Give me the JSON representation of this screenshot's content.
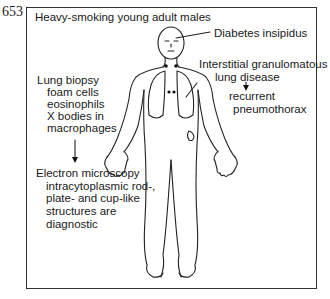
{
  "figure": {
    "number": "653",
    "title": "Heavy-smoking young adult males",
    "labels": {
      "head": "Diabetes insipidus",
      "lung_1": "Interstitial granulomatous",
      "lung_2": "lung disease",
      "comp_1": "recurrent",
      "comp_2": "pneumothorax",
      "biopsy_title": "Lung biopsy",
      "biopsy_1": "foam cells",
      "biopsy_2": "eosinophils",
      "biopsy_3": "X bodies in",
      "biopsy_4": "macrophages",
      "em_title": "Electron microscopy",
      "em_1": "intracytoplasmic rod-,",
      "em_2": "plate- and cup-like",
      "em_3": "structures are",
      "em_4": "diagnostic"
    }
  }
}
